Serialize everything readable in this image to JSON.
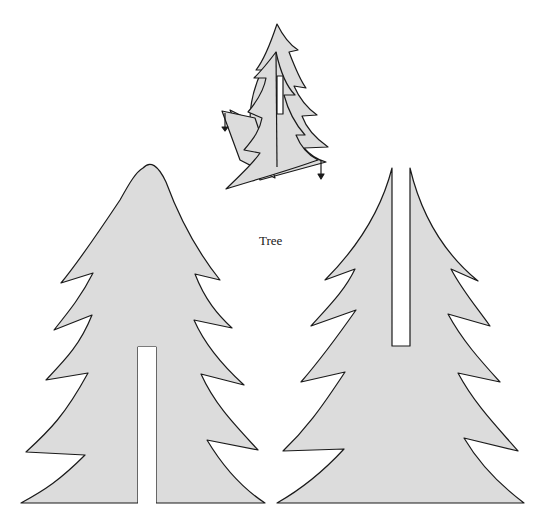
{
  "diagram": {
    "title_label": "Tree",
    "fill_color": "#dcdcdc",
    "stroke_color": "#1a1a1a",
    "background": "#ffffff",
    "parts": [
      {
        "id": "assembled-tree",
        "description": "Assembled tree: two slotted pieces interlocked at right angles, with down arrows"
      },
      {
        "id": "tree-piece-bottom-slot",
        "description": "Tree cutout with slot from bottom"
      },
      {
        "id": "tree-piece-top-slot",
        "description": "Tree cutout with slot from top"
      }
    ]
  }
}
